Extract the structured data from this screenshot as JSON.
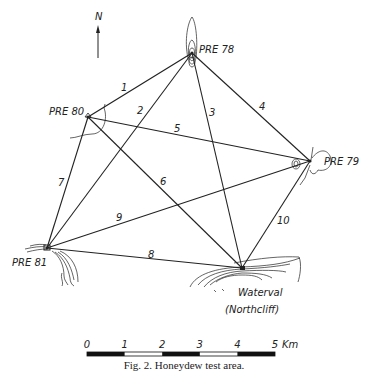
{
  "north_arrow": {
    "label": "N"
  },
  "stations": [
    {
      "id": "pre78",
      "label": "PRE 78",
      "x": 192,
      "y": 53,
      "lx": 199,
      "ly": 53
    },
    {
      "id": "pre80",
      "label": "PRE 80",
      "x": 88,
      "y": 117,
      "lx": 49,
      "ly": 115
    },
    {
      "id": "pre79",
      "label": "PRE 79",
      "x": 310,
      "y": 161,
      "lx": 324,
      "ly": 165
    },
    {
      "id": "pre81",
      "label": "PRE 81",
      "x": 47,
      "y": 248,
      "lx": 12,
      "ly": 266
    },
    {
      "id": "waterval",
      "label": "Waterval",
      "label2": "(Northcliff)",
      "x": 242,
      "y": 268,
      "lx": 238,
      "ly": 296,
      "lx2": 225,
      "ly2": 313
    }
  ],
  "lines": [
    {
      "num": "1",
      "from": "pre80",
      "to": "pre78",
      "lx": 121,
      "ly": 91
    },
    {
      "num": "2",
      "from": "pre81",
      "to": "pre78",
      "lx": 137,
      "ly": 114
    },
    {
      "num": "3",
      "from": "pre78",
      "to": "waterval",
      "lx": 209,
      "ly": 116
    },
    {
      "num": "4",
      "from": "pre78",
      "to": "pre79",
      "lx": 259,
      "ly": 110
    },
    {
      "num": "5",
      "from": "pre80",
      "to": "pre79",
      "lx": 174,
      "ly": 132
    },
    {
      "num": "6",
      "from": "pre80",
      "to": "waterval",
      "lx": 160,
      "ly": 185
    },
    {
      "num": "7",
      "from": "pre80",
      "to": "pre81",
      "lx": 58,
      "ly": 186
    },
    {
      "num": "8",
      "from": "pre81",
      "to": "waterval",
      "lx": 148,
      "ly": 258
    },
    {
      "num": "9",
      "from": "pre81",
      "to": "pre79",
      "lx": 116,
      "ly": 221
    },
    {
      "num": "10",
      "from": "waterval",
      "to": "pre79",
      "lx": 277,
      "ly": 224
    }
  ],
  "scale_bar": {
    "ticks": [
      "0",
      "1",
      "2",
      "3",
      "4",
      "5"
    ],
    "unit": "Km"
  },
  "caption": "Fig. 2. Honeydew test area."
}
